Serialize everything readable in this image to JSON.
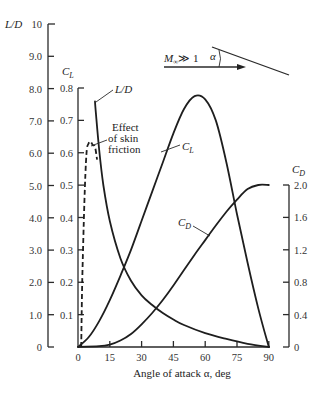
{
  "chart_data": {
    "type": "line",
    "title": "",
    "xlabel": "Angle of attack α, deg",
    "x_ticks": [
      0,
      15,
      30,
      45,
      60,
      75,
      90
    ],
    "xlim": [
      0,
      90
    ],
    "axes": {
      "ld": {
        "label": "L/D",
        "ticks": [
          "0",
          "1.0",
          "2.0",
          "3.0",
          "4.0",
          "5.0",
          "6.0",
          "7.0",
          "8.0",
          "9.0",
          "10"
        ],
        "ylim": [
          0,
          10
        ],
        "position": "left-outer"
      },
      "cl": {
        "label": "C_L",
        "ticks": [
          "0.1",
          "0.2",
          "0.3",
          "0.4",
          "0.5",
          "0.6",
          "0.7",
          "0.8"
        ],
        "ylim": [
          0,
          0.8
        ],
        "position": "left-inner"
      },
      "cd": {
        "label": "C_D",
        "ticks": [
          "0",
          "0.4",
          "0.8",
          "1.2",
          "1.6",
          "2.0"
        ],
        "ylim": [
          0,
          2.0
        ],
        "position": "right"
      }
    },
    "grid": false,
    "series": [
      {
        "name": "L/D",
        "axis": "ld",
        "style": "solid",
        "x": [
          8,
          8.5,
          10,
          12,
          15,
          20,
          25,
          30,
          35,
          40,
          45,
          50,
          60,
          70,
          80,
          90
        ],
        "values": [
          7.6,
          7.2,
          6.1,
          5.0,
          3.9,
          2.75,
          2.05,
          1.6,
          1.3,
          1.05,
          0.85,
          0.68,
          0.43,
          0.25,
          0.1,
          0
        ]
      },
      {
        "name": "L/D (effect of skin friction)",
        "axis": "ld",
        "style": "dashed",
        "x": [
          1.5,
          2,
          3,
          4,
          5,
          6,
          7,
          8,
          9
        ],
        "values": [
          0,
          2.0,
          4.5,
          6.0,
          6.3,
          6.35,
          6.25,
          6.2,
          5.8
        ]
      },
      {
        "name": "C_L",
        "axis": "cl",
        "style": "solid",
        "x": [
          0,
          5,
          10,
          15,
          20,
          25,
          30,
          35,
          40,
          45,
          50,
          55,
          60,
          65,
          70,
          75,
          80,
          85,
          90
        ],
        "values": [
          0,
          0.03,
          0.08,
          0.145,
          0.22,
          0.3,
          0.39,
          0.48,
          0.57,
          0.66,
          0.735,
          0.775,
          0.765,
          0.7,
          0.57,
          0.41,
          0.26,
          0.12,
          0
        ]
      },
      {
        "name": "C_D",
        "axis": "cd",
        "style": "solid",
        "x": [
          0,
          10,
          15,
          20,
          25,
          30,
          35,
          40,
          45,
          50,
          55,
          60,
          65,
          70,
          75,
          80,
          85,
          90
        ],
        "values": [
          0,
          0.01,
          0.03,
          0.08,
          0.16,
          0.28,
          0.42,
          0.58,
          0.76,
          0.95,
          1.14,
          1.32,
          1.5,
          1.67,
          1.82,
          1.95,
          2.0,
          2.0
        ]
      }
    ],
    "annotations": [
      {
        "text": "L/D",
        "target": "L/D peak"
      },
      {
        "text": "Effect of skin friction",
        "target": "dashed L/D"
      },
      {
        "text": "C_L",
        "target": "C_L curve"
      },
      {
        "text": "C_D",
        "target": "C_D curve"
      }
    ],
    "inset": {
      "freestream_label": "M∞ ≫ 1",
      "angle_label": "α"
    }
  },
  "labels": {
    "ld_axis_title": "L/D",
    "cl_axis_title": "C",
    "cl_axis_sub": "L",
    "cd_axis_title": "C",
    "cd_axis_sub": "D",
    "xlabel": "Angle of attack α, deg",
    "ld_callout": "L/D",
    "friction_line1": "Effect",
    "friction_line2": "of skin",
    "friction_line3": "friction",
    "cl_callout": "C",
    "cl_callout_sub": "L",
    "cd_callout": "C",
    "cd_callout_sub": "D",
    "inset_mach": "M",
    "inset_mach_sub": "∞",
    "inset_mach_rel": "≫ 1",
    "inset_alpha": "α"
  }
}
